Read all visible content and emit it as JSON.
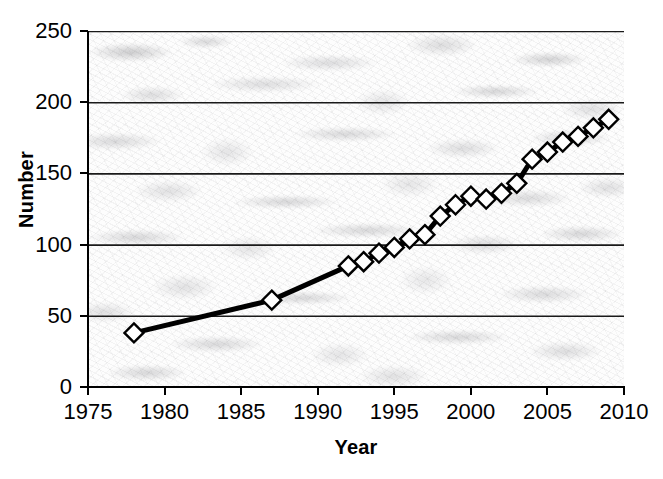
{
  "chart_data": {
    "type": "line",
    "title": "",
    "xlabel": "Year",
    "ylabel": "Number",
    "xlim": [
      1975,
      2010
    ],
    "ylim": [
      0,
      250
    ],
    "xticks": [
      1975,
      1980,
      1985,
      1990,
      1995,
      2000,
      2005,
      2010
    ],
    "yticks": [
      0,
      50,
      100,
      150,
      200,
      250
    ],
    "grid": "horizontal",
    "legend": "none",
    "marker": "white-diamond",
    "line_color": "#000000",
    "marker_fill": "#ffffff",
    "marker_edge": "#000000",
    "plot_background": "marble-texture",
    "series": [
      {
        "name": "Number",
        "x": [
          1978,
          1987,
          1992,
          1993,
          1994,
          1995,
          1996,
          1997,
          1998,
          1999,
          2000,
          2001,
          2002,
          2003,
          2004,
          2005,
          2006,
          2007,
          2008,
          2009
        ],
        "values": [
          38,
          61,
          85,
          88,
          94,
          98,
          104,
          107,
          120,
          128,
          134,
          132,
          136,
          143,
          160,
          165,
          172,
          176,
          182,
          188
        ]
      }
    ]
  },
  "axes": {
    "y_title": "Number",
    "x_title": "Year",
    "y_tick_labels": [
      "250",
      "200",
      "150",
      "100",
      "50",
      "0"
    ],
    "x_tick_labels": [
      "1975",
      "1980",
      "1985",
      "1990",
      "1995",
      "2000",
      "2005",
      "2010"
    ]
  }
}
